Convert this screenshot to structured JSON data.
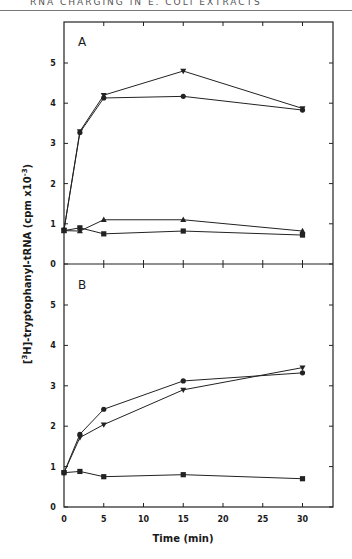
{
  "header": {
    "running_head": "RNA CHARGING IN E. COLI EXTRACTS"
  },
  "axes": {
    "xlabel": "Time (min)",
    "ylabel_prefix": "[",
    "ylabel_sup": "3",
    "ylabel_main": "H]-tryptophanyl-tRNA (cpm x10",
    "ylabel_exp": "-3",
    "ylabel_close": ")",
    "x_ticks": [
      "0",
      "5",
      "10",
      "15",
      "20",
      "25",
      "30"
    ],
    "y_ticks": [
      "0",
      "1",
      "2",
      "3",
      "4",
      "5"
    ]
  },
  "panels": [
    {
      "label": "A"
    },
    {
      "label": "B"
    }
  ],
  "chart_data": [
    {
      "type": "line",
      "panel": "A",
      "title": "A",
      "xlabel": "Time (min)",
      "ylabel": "[3H]-tryptophanyl-tRNA (cpm x10^-3)",
      "xlim": [
        0,
        34
      ],
      "ylim": [
        0,
        6
      ],
      "x": [
        0,
        2,
        5,
        15,
        30
      ],
      "x_ticks": [
        0,
        5,
        10,
        15,
        20,
        25,
        30
      ],
      "y_ticks": [
        0,
        1,
        2,
        3,
        4,
        5
      ],
      "grid": false,
      "series": [
        {
          "name": "inverted-triangle",
          "marker": "inverted-triangle",
          "values": [
            0.85,
            3.3,
            4.2,
            4.8,
            3.87
          ]
        },
        {
          "name": "circle",
          "marker": "circle",
          "values": [
            0.85,
            3.27,
            4.13,
            4.17,
            3.83
          ]
        },
        {
          "name": "triangle",
          "marker": "triangle",
          "values": [
            0.83,
            0.82,
            1.1,
            1.1,
            0.82
          ]
        },
        {
          "name": "square",
          "marker": "square",
          "values": [
            0.83,
            0.9,
            0.75,
            0.82,
            0.72
          ]
        }
      ]
    },
    {
      "type": "line",
      "panel": "B",
      "title": "B",
      "xlabel": "Time (min)",
      "ylabel": "[3H]-tryptophanyl-tRNA (cpm x10^-3)",
      "xlim": [
        0,
        34
      ],
      "ylim": [
        0,
        6
      ],
      "x": [
        0,
        2,
        5,
        15,
        30
      ],
      "x_ticks": [
        0,
        5,
        10,
        15,
        20,
        25,
        30
      ],
      "y_ticks": [
        0,
        1,
        2,
        3,
        4,
        5
      ],
      "grid": false,
      "series": [
        {
          "name": "circle",
          "marker": "circle",
          "values": [
            0.85,
            1.8,
            2.42,
            3.12,
            3.32
          ]
        },
        {
          "name": "inverted-triangle",
          "marker": "inverted-triangle",
          "values": [
            0.85,
            1.72,
            2.04,
            2.9,
            3.45
          ]
        },
        {
          "name": "square",
          "marker": "square",
          "values": [
            0.85,
            0.88,
            0.75,
            0.8,
            0.7
          ]
        }
      ]
    }
  ]
}
